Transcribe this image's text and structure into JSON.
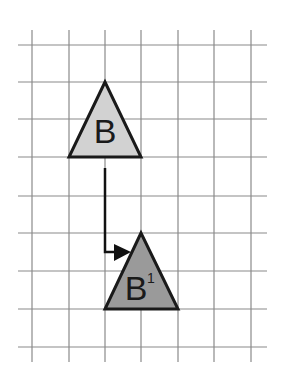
{
  "diagram": {
    "type": "translation-on-grid",
    "canvas": {
      "width": 289,
      "height": 372,
      "background": "#ffffff"
    },
    "grid": {
      "line_color": "#8a8a8a",
      "vertical_x": [
        32,
        69,
        105,
        141,
        178,
        214,
        251
      ],
      "vertical_y_range": [
        30,
        362
      ],
      "horizontal_y": [
        45,
        82,
        119,
        157,
        196,
        233,
        271,
        309,
        347
      ],
      "horizontal_x_range": [
        18,
        267
      ]
    },
    "shapes": [
      {
        "id": "B",
        "label": "B",
        "superscript": "",
        "points": [
          [
            105,
            82
          ],
          [
            69,
            157
          ],
          [
            141,
            157
          ]
        ],
        "fill": "#d2d2d2",
        "stroke": "#1a1a1a",
        "label_pos": [
          105,
          143
        ]
      },
      {
        "id": "B1",
        "label": "B",
        "superscript": "1",
        "points": [
          [
            141,
            233
          ],
          [
            105,
            309
          ],
          [
            178,
            309
          ]
        ],
        "fill": "#9a9a9a",
        "stroke": "#1a1a1a",
        "label_pos": [
          136,
          300
        ],
        "superscript_pos": [
          151,
          283
        ]
      }
    ],
    "arrow": {
      "path": [
        [
          105,
          168
        ],
        [
          105,
          252
        ],
        [
          115,
          252
        ]
      ],
      "head": [
        [
          114,
          244
        ],
        [
          131,
          252
        ],
        [
          114,
          261
        ]
      ],
      "color": "#111111"
    },
    "labels": {
      "shape_b": "B",
      "shape_b1_main": "B",
      "shape_b1_sup": "1"
    }
  }
}
